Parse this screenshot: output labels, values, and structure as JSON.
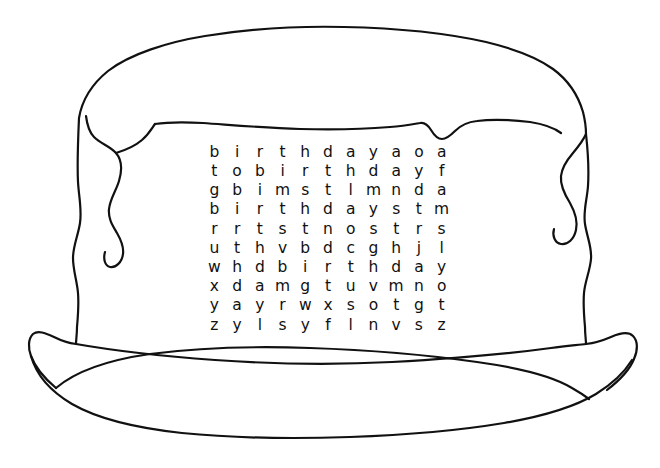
{
  "image": {
    "title": "Birthday Cake Word Search",
    "subject": "birthday-cake",
    "style": "hand-drawn black ink line art on white",
    "width": 660,
    "height": 468,
    "stroke_color": "#111111",
    "background_color": "#ffffff"
  },
  "drawing": {
    "parts": [
      {
        "name": "cake-top-dome",
        "label": "cake top"
      },
      {
        "name": "cake-frosting-drip-left",
        "label": "frosting drip left"
      },
      {
        "name": "cake-frosting-drip-right",
        "label": "frosting drip right"
      },
      {
        "name": "cake-frosting-edge",
        "label": "frosting lower edge"
      },
      {
        "name": "cake-body-left",
        "label": "cake side left"
      },
      {
        "name": "cake-body-right",
        "label": "cake side right"
      },
      {
        "name": "cake-base-line",
        "label": "cake bottom"
      },
      {
        "name": "plate",
        "label": "plate"
      }
    ]
  },
  "puzzle": {
    "type": "word-search",
    "rows": 10,
    "cols": 11,
    "grid": [
      [
        "b",
        "i",
        "r",
        "t",
        "h",
        "d",
        "a",
        "y",
        "a",
        "o",
        "a"
      ],
      [
        "t",
        "o",
        "b",
        "i",
        "r",
        "t",
        "h",
        "d",
        "a",
        "y",
        "f"
      ],
      [
        "g",
        "b",
        "i",
        "m",
        "s",
        "t",
        "l",
        "m",
        "n",
        "d",
        "a"
      ],
      [
        "b",
        "i",
        "r",
        "t",
        "h",
        "d",
        "a",
        "y",
        "s",
        "t",
        "m"
      ],
      [
        "r",
        "r",
        "t",
        "s",
        "t",
        "n",
        "o",
        "s",
        "t",
        "r",
        "s"
      ],
      [
        "u",
        "t",
        "h",
        "v",
        "b",
        "d",
        "c",
        "g",
        "h",
        "j",
        "l"
      ],
      [
        "w",
        "h",
        "d",
        "b",
        "i",
        "r",
        "t",
        "h",
        "d",
        "a",
        "y"
      ],
      [
        "x",
        "d",
        "a",
        "m",
        "g",
        "t",
        "u",
        "v",
        "m",
        "n",
        "o"
      ],
      [
        "y",
        "a",
        "y",
        "r",
        "w",
        "x",
        "s",
        "o",
        "t",
        "g",
        "t"
      ],
      [
        "z",
        "y",
        "l",
        "s",
        "y",
        "f",
        "l",
        "n",
        "v",
        "s",
        "z"
      ]
    ]
  }
}
